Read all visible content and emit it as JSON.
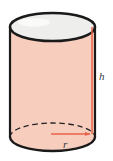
{
  "figure": {
    "name": "cylinder-diagram",
    "kind": "solid-geometry-figure",
    "shape_label": "cylinder",
    "background_color": "#ffffff",
    "width": 113,
    "height": 161
  },
  "colors": {
    "body_fill": "#f7cdbe",
    "top_face_fill": "#eeeeec",
    "outline": "#1a1a1a",
    "dimension_line": "#e8634a",
    "label_text": "#3a3a3a"
  },
  "labels": {
    "height": "h",
    "radius": "r"
  },
  "parts": {
    "top_ellipse": "top-circular-face",
    "bottom_ellipse": "bottom-circular-face",
    "lateral_surface": "lateral-surface",
    "hidden_back_arc": "dashed-hidden-back-arc",
    "height_line": "height-dimension-line",
    "radius_arrow": "radius-dimension-arrow"
  },
  "geometry": {
    "left_edge_x": 10,
    "right_edge_x": 95,
    "top_center_y": 27,
    "bottom_center_y": 137,
    "ellipse_rx": 42.5,
    "ellipse_ry": 14,
    "height_line_x": 92,
    "radius_arrow_y": 134,
    "radius_arrow_x_start": 51,
    "radius_arrow_x_end": 92
  }
}
